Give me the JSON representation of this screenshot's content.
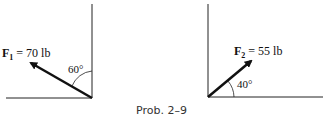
{
  "figure": {
    "caption": "Prob. 2–9",
    "left": {
      "force_symbol": "F",
      "force_subscript": "1",
      "force_value": " = 70 lb",
      "angle": "60°",
      "angle_reference": "vertical"
    },
    "right": {
      "force_symbol": "F",
      "force_subscript": "2",
      "force_value": " = 55 lb",
      "angle": "40°",
      "angle_reference": "horizontal"
    }
  }
}
